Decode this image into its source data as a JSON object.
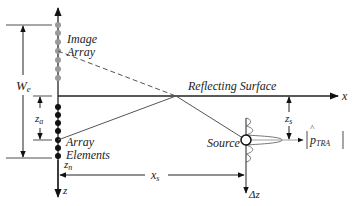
{
  "diagram": {
    "labels": {
      "image_array_line1": "Image",
      "image_array_line2": "Array",
      "array_elements_line1": "Array",
      "array_elements_line2": "Elements",
      "reflecting_surface": "Reflecting Surface",
      "source": "Source",
      "x_axis": "x",
      "z_axis": "z",
      "we": "W",
      "we_sub": "e",
      "za": "z",
      "za_sub": "a",
      "zn": "z",
      "zn_sub": "n",
      "zs": "z",
      "zs_sub": "s",
      "xs": "x",
      "xs_sub": "s",
      "dz": "Δz",
      "ptra": "p",
      "ptra_hat": "^",
      "ptra_sub": "TRA"
    },
    "colors": {
      "line": "#222222",
      "image_dots": "#9a9a9a",
      "element_dots": "#111111",
      "ray": "#555555"
    },
    "image_array_count": 7,
    "array_element_count": 7
  }
}
